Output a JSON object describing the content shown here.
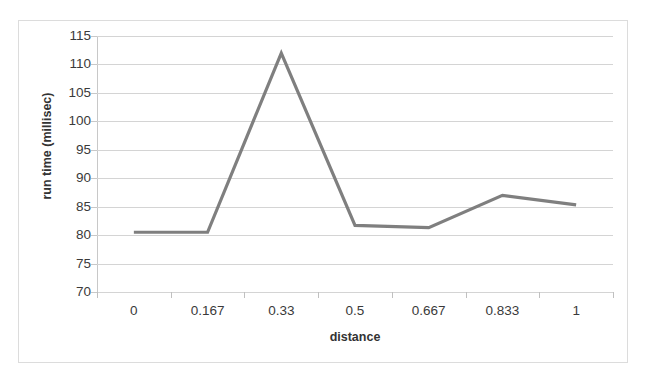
{
  "chart_data": {
    "type": "line",
    "title": "",
    "subtitle": "",
    "xlabel": "distance",
    "ylabel": "run time (millisec)",
    "categories": [
      "0",
      "0.167",
      "0.33",
      "0.5",
      "0.667",
      "0.833",
      "1"
    ],
    "values": [
      80.5,
      80.5,
      112.0,
      81.7,
      81.3,
      87.0,
      85.3
    ],
    "series": [
      {
        "name": "run time",
        "values": [
          80.5,
          80.5,
          112.0,
          81.7,
          81.3,
          87.0,
          85.3
        ],
        "color": "#7f7f7f"
      }
    ],
    "ylim": [
      70,
      115
    ],
    "y_ticks": [
      70,
      75,
      80,
      85,
      90,
      95,
      100,
      105,
      110,
      115
    ],
    "y_tick_labels": [
      "70",
      "75",
      "80",
      "85",
      "90",
      "95",
      "100",
      "105",
      "110",
      "115"
    ],
    "grid": "horizontal",
    "legend": "none",
    "annotations": [],
    "colors": {
      "line": "#7f7f7f",
      "gridline": "#d4d4d4",
      "axis": "#c0c0c0",
      "border": "#dcdcdc",
      "text": "#3a3a3a",
      "background": "#ffffff"
    }
  }
}
